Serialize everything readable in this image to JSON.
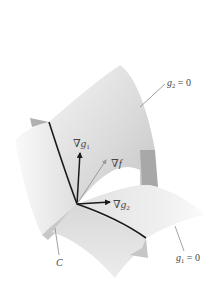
{
  "diagram": {
    "type": "lagrange-two-constraints",
    "surfaces": [
      {
        "id": "g2",
        "label": "g₂ = 0",
        "label_text": "g",
        "label_sub": "2",
        "label_rest": " = 0"
      },
      {
        "id": "g1",
        "label": "g₁ = 0",
        "label_text": "g",
        "label_sub": "1",
        "label_rest": " = 0"
      }
    ],
    "curve": {
      "label": "C"
    },
    "vectors": [
      {
        "id": "grad-g1",
        "label": "∇g₁",
        "nabla": "∇",
        "var": "g",
        "sub": "1",
        "color": "#1a1a1a"
      },
      {
        "id": "grad-f",
        "label": "∇f",
        "nabla": "∇",
        "var": "f",
        "sub": "",
        "color": "#9a9a9a"
      },
      {
        "id": "grad-g2",
        "label": "∇g₂",
        "nabla": "∇",
        "var": "g",
        "sub": "2",
        "color": "#1a1a1a"
      }
    ],
    "colors": {
      "surface_light": "#eeeeee",
      "surface_mid": "#d6d6d6",
      "surface_dark": "#b8b8b8",
      "curve": "#1a1a1a",
      "leader": "#8a8a8a"
    }
  }
}
